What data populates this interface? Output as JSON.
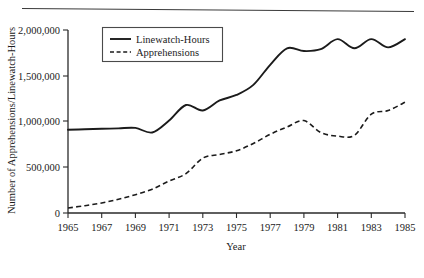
{
  "figure": {
    "has_top_rule": true
  },
  "chart_data": {
    "type": "line",
    "title": "",
    "xlabel": "Year",
    "ylabel": "Number of Apprehensions/Linewatch-Hours",
    "xlim": [
      1965,
      1985
    ],
    "ylim": [
      0,
      2000000
    ],
    "grid": false,
    "legend_position": "top-left-inside",
    "x_tick_labels": [
      "1965",
      "1967",
      "1969",
      "1971",
      "1973",
      "1975",
      "1977",
      "1979",
      "1981",
      "1983",
      "1985"
    ],
    "x_ticks": [
      1965,
      1967,
      1969,
      1971,
      1973,
      1975,
      1977,
      1979,
      1981,
      1983,
      1985
    ],
    "y_tick_labels": [
      "0",
      "500,000",
      "1,000,000",
      "1,500,000",
      "2,000,000"
    ],
    "y_ticks": [
      0,
      500000,
      1000000,
      1500000,
      2000000
    ],
    "x": [
      1965,
      1966,
      1967,
      1968,
      1969,
      1970,
      1971,
      1972,
      1973,
      1974,
      1975,
      1976,
      1977,
      1978,
      1979,
      1980,
      1981,
      1982,
      1983,
      1984,
      1985
    ],
    "series": [
      {
        "name": "Linewatch-Hours",
        "style": "solid",
        "color": "#1b1b1b",
        "values": [
          910000,
          915000,
          920000,
          925000,
          930000,
          880000,
          1010000,
          1180000,
          1120000,
          1230000,
          1290000,
          1400000,
          1620000,
          1800000,
          1770000,
          1790000,
          1900000,
          1800000,
          1900000,
          1810000,
          1900000
        ]
      },
      {
        "name": "Apprehensions",
        "style": "dashed",
        "color": "#1b1b1b",
        "values": [
          55000,
          80000,
          110000,
          150000,
          200000,
          260000,
          350000,
          430000,
          600000,
          640000,
          680000,
          760000,
          860000,
          940000,
          1010000,
          880000,
          840000,
          850000,
          1080000,
          1120000,
          1210000
        ]
      }
    ]
  },
  "legend": {
    "entries": [
      {
        "label": "Linewatch-Hours",
        "style": "solid"
      },
      {
        "label": "Apprehensions",
        "style": "dashed"
      }
    ]
  }
}
